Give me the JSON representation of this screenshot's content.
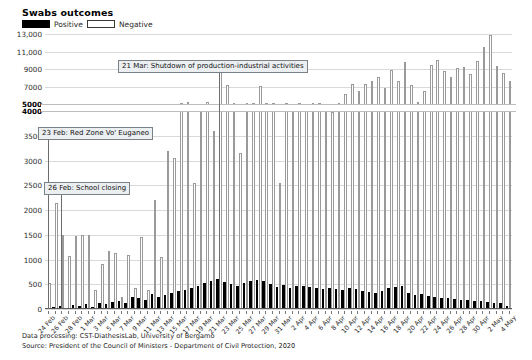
{
  "header": {
    "title": "Swabs outcomes",
    "legend": [
      {
        "label": "Positive",
        "color": "#000000",
        "key": "positive"
      },
      {
        "label": "Negative",
        "color": "#ffffff",
        "key": "negative"
      }
    ]
  },
  "footer": {
    "line1": "Data processing: CST-DiathesisLab, University of Bergamo",
    "line2": "Source: President of the Council of Ministers - Department of Civil Protection, 2020"
  },
  "annotations": [
    {
      "name": "annotation-red-zone",
      "text": "23 Feb: Red Zone Vo' Euganeo",
      "x_index": 0,
      "left_px": 38,
      "top_px": 127,
      "line_top": 140,
      "line_bottom": 309
    },
    {
      "name": "annotation-school-closing",
      "text": "26 Feb: School closing",
      "x_index": 2,
      "left_px": 44,
      "top_px": 182,
      "line_top": 194,
      "line_bottom": 309
    },
    {
      "name": "annotation-shutdown",
      "text": "21 Mar: Shutdown of production-industrial activities",
      "x_index": 26,
      "left_px": 118,
      "top_px": 60,
      "line_top": 72,
      "line_bottom": 309
    }
  ],
  "chart_data": {
    "type": "bar",
    "title": "Swabs outcomes",
    "xlabel": "",
    "ylabel": "",
    "grid": true,
    "legend_position": "top-left",
    "broken_axis": true,
    "axis_break": {
      "lower_max": 4000,
      "upper_min": 5000,
      "note": "y-axis broken between 4000 and 5000"
    },
    "lower_ticks": [
      0,
      500,
      1000,
      1500,
      2000,
      2500,
      3000,
      3500,
      4000
    ],
    "upper_ticks": [
      5000,
      7000,
      9000,
      11000,
      13000
    ],
    "ytick_labels": [
      "0",
      "500",
      "1000",
      "1500",
      "2000",
      "2500",
      "3000",
      "3500",
      "4000",
      "5000",
      "7000",
      "9000",
      "11,000",
      "13,000"
    ],
    "ylim": [
      0,
      13500
    ],
    "categories": [
      "24 Feb",
      "25 Feb",
      "26 Feb",
      "27 Feb",
      "28 Feb",
      "29 Feb",
      "1 Mar",
      "2 Mar",
      "3 Mar",
      "4 Mar",
      "5 Mar",
      "6 Mar",
      "7 Mar",
      "8 Mar",
      "9 Mar",
      "10 Mar",
      "11 Mar",
      "12 Mar",
      "13 Mar",
      "14 Mar",
      "15 Mar",
      "16 Mar",
      "17 Mar",
      "18 Mar",
      "19 Mar",
      "20 Mar",
      "21 Mar",
      "22 Mar",
      "23 Mar",
      "24 Mar",
      "25 Mar",
      "26 Mar",
      "27 Mar",
      "28 Mar",
      "29 Mar",
      "30 Mar",
      "31 Mar",
      "1 Apr",
      "2 Apr",
      "3 Apr",
      "4 Apr",
      "5 Apr",
      "6 Apr",
      "7 Apr",
      "8 Apr",
      "9 Apr",
      "10 Apr",
      "11 Apr",
      "12 Apr",
      "13 Apr",
      "14 Apr",
      "15 Apr",
      "16 Apr",
      "17 Apr",
      "18 Apr",
      "19 Apr",
      "20 Apr",
      "21 Apr",
      "22 Apr",
      "23 Apr",
      "24 Apr",
      "25 Apr",
      "26 Apr",
      "27 Apr",
      "28 Apr",
      "29 Apr",
      "30 Apr",
      "1 May",
      "2 May",
      "3 May",
      "4 May"
    ],
    "xtick_labels_shown": [
      "24 Feb",
      "26 Feb",
      "28 Feb",
      "1 Mar",
      "3 Mar",
      "5 Mar",
      "7 Mar",
      "9 Mar",
      "11 Mar",
      "13 Mar",
      "15 Mar",
      "17 Mar",
      "19 Mar",
      "21 Mar",
      "23 Mar",
      "25 Mar",
      "27 Mar",
      "29 Mar",
      "31 Mar",
      "2 Apr",
      "4 Apr",
      "6 Apr",
      "8 Apr",
      "10 Apr",
      "12 Apr",
      "14 Apr",
      "16 Apr",
      "18 Apr",
      "20 Apr",
      "22 Apr",
      "24 Apr",
      "26 Apr",
      "28 Apr",
      "30 Apr",
      "2 May",
      "4 May"
    ],
    "series": [
      {
        "name": "Positive",
        "key": "positive",
        "color": "#000000",
        "values": [
          20,
          40,
          60,
          30,
          90,
          70,
          110,
          50,
          120,
          100,
          140,
          160,
          130,
          250,
          220,
          190,
          300,
          240,
          280,
          330,
          360,
          390,
          420,
          470,
          520,
          560,
          600,
          540,
          500,
          470,
          520,
          560,
          590,
          560,
          500,
          450,
          480,
          430,
          460,
          470,
          440,
          420,
          400,
          430,
          410,
          390,
          420,
          400,
          370,
          340,
          320,
          360,
          420,
          450,
          470,
          330,
          280,
          300,
          260,
          240,
          230,
          220,
          200,
          180,
          190,
          170,
          160,
          150,
          130,
          120,
          70
        ]
      },
      {
        "name": "Negative",
        "key": "negative",
        "color": "#ffffff",
        "values": [
          520,
          2150,
          1500,
          1080,
          1480,
          1500,
          1490,
          380,
          900,
          1180,
          1140,
          250,
          1100,
          430,
          1450,
          390,
          2200,
          1050,
          3200,
          3050,
          5100,
          5200,
          2550,
          5050,
          5200,
          3600,
          9000,
          7150,
          5150,
          3150,
          5100,
          5100,
          7050,
          5150,
          5100,
          2550,
          5100,
          5050,
          5100,
          5050,
          5100,
          5100,
          5050,
          4100,
          5150,
          6200,
          7300,
          6500,
          7350,
          7700,
          8100,
          6800,
          8900,
          7600,
          9800,
          7200,
          5200,
          6500,
          9500,
          10050,
          8800,
          8100,
          9100,
          9300,
          8500,
          9900,
          11600,
          12950,
          9400,
          8600,
          7700
        ]
      }
    ]
  }
}
